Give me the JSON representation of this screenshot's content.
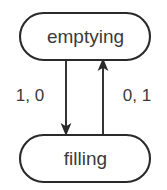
{
  "diagram": {
    "type": "state-transition-diagram",
    "title": "",
    "canvas": {
      "width": 167,
      "height": 190,
      "background": "#ffffff"
    },
    "style": {
      "stroke_color": "#2a2a2a",
      "text_color": "#3a3a3a",
      "node_fill": "#ffffff",
      "stroke_width": 2
    },
    "nodes": [
      {
        "id": "emptying",
        "label": "emptying",
        "shape": "stadium",
        "x": 20,
        "y": 13,
        "width": 130,
        "height": 47
      },
      {
        "id": "filling",
        "label": "filling",
        "shape": "stadium",
        "x": 20,
        "y": 135,
        "width": 130,
        "height": 47
      }
    ],
    "transitions": [
      {
        "id": "emptying-to-filling",
        "from": "emptying",
        "to": "filling",
        "label": "1, 0",
        "direction": "down",
        "line_x": 66,
        "label_x": 30,
        "label_y": 97
      },
      {
        "id": "filling-to-emptying",
        "from": "filling",
        "to": "emptying",
        "label": "0, 1",
        "direction": "up",
        "line_x": 103,
        "label_x": 137,
        "label_y": 97
      }
    ]
  }
}
